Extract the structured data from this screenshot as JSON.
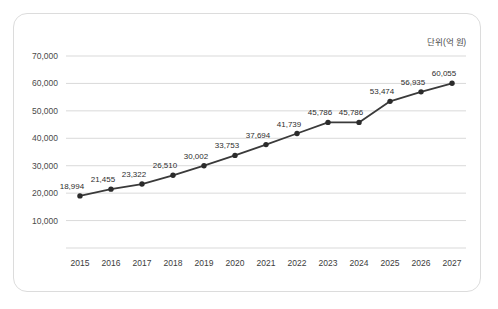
{
  "card": {
    "unit_label": "단위(억 원)"
  },
  "chart_data": {
    "type": "line",
    "title": "",
    "subtitle": "",
    "xlabel": "",
    "ylabel": "",
    "unit_note": "단위(억 원)",
    "grid": "horizontal",
    "legend": "none",
    "ylim": [
      0,
      70000
    ],
    "y_ticks": [
      10000,
      20000,
      30000,
      40000,
      50000,
      60000,
      70000
    ],
    "y_tick_labels": [
      "10,000",
      "20,000",
      "30,000",
      "40,000",
      "50,000",
      "60,000",
      "70,000"
    ],
    "categories": [
      "2015",
      "2016",
      "2017",
      "2018",
      "2019",
      "2020",
      "2021",
      "2022",
      "2023",
      "2024",
      "2025",
      "2026",
      "2027"
    ],
    "values": [
      18994,
      21455,
      23322,
      26510,
      30002,
      33753,
      37694,
      41739,
      45786,
      45786,
      53474,
      56935,
      60055
    ],
    "point_labels": [
      "18,994",
      "21,455",
      "23,322",
      "26,510",
      "30,002",
      "33,753",
      "37,694",
      "41,739",
      "45,786",
      "45,786",
      "53,474",
      "56,935",
      "60,055"
    ],
    "series": [
      {
        "name": "",
        "color": "#3a3a3a",
        "marker": "circle",
        "values": [
          18994,
          21455,
          23322,
          26510,
          30002,
          33753,
          37694,
          41739,
          45786,
          45786,
          53474,
          56935,
          60055
        ]
      }
    ]
  },
  "colors": {
    "line": "#3a3a3a",
    "marker": "#2b2b2b",
    "grid": "#c9c9c9",
    "card_border": "#dcdcdc",
    "text": "#3c3c3c",
    "background": "#ffffff"
  }
}
